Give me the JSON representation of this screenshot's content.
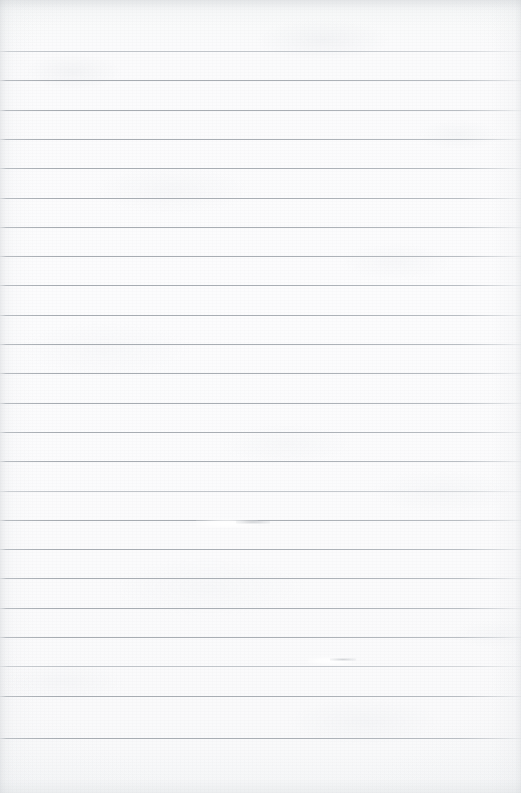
{
  "document": {
    "kind": "scanned-ruled-notebook-page",
    "title": "Blank ruled notebook page",
    "content_text": "",
    "is_blank": true,
    "page_width": 521,
    "page_height": 793,
    "paper_color": "#fbfbfc",
    "rule_color": "#aab0b6",
    "edge_shadow_color": "#bec2c6"
  },
  "ruling": {
    "style": "wide-ruled horizontal lines",
    "line_count": 24,
    "first_line_y": 51,
    "last_line_y": 738,
    "line_spacing": 29.3,
    "line_thickness": 1,
    "top_margin": 51,
    "bottom_margin": 55,
    "left_margin": 0,
    "right_margin": 0,
    "has_vertical_margin_rule": false,
    "line_y_positions": [
      51,
      80.3,
      109.6,
      138.9,
      168.2,
      197.5,
      226.8,
      256.1,
      285.4,
      314.7,
      344,
      373.3,
      402.6,
      431.9,
      461.2,
      490.5,
      519.8,
      549.1,
      578.4,
      607.7,
      637,
      666.3,
      695.6,
      738
    ],
    "faint_line_indices": [
      0,
      15,
      21
    ]
  },
  "marks": [
    {
      "name": "erasure-gap-upper",
      "type": "erasure-gap",
      "x": 196,
      "y": 519,
      "width": 62,
      "height": 9
    },
    {
      "name": "erasure-smudge-upper",
      "type": "graphite-smudge",
      "x": 236,
      "y": 520,
      "width": 34,
      "height": 4
    },
    {
      "name": "erasure-gap-lower",
      "type": "erasure-gap",
      "x": 308,
      "y": 657,
      "width": 44,
      "height": 8
    },
    {
      "name": "erasure-smudge-lower",
      "type": "graphite-smudge",
      "x": 330,
      "y": 658,
      "width": 26,
      "height": 3
    }
  ]
}
